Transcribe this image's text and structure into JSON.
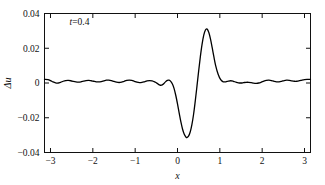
{
  "chart_data": {
    "type": "line",
    "title": "",
    "subtitle": "",
    "xlabel": "x",
    "ylabel": "Δu",
    "xlim": [
      -3.14159,
      3.14159
    ],
    "ylim": [
      -0.04,
      0.04
    ],
    "xticks": [
      -3,
      -2,
      -1,
      0,
      1,
      2,
      3
    ],
    "xticklabels": [
      "−3",
      "−2",
      "−1",
      "0",
      "1",
      "2",
      "3"
    ],
    "yticks": [
      -0.04,
      -0.02,
      0,
      0.02,
      0.04
    ],
    "yticklabels": [
      "−0.04",
      "−0.02",
      "0",
      "0.02",
      "0.04"
    ],
    "grid": false,
    "legend": null,
    "annotations": [
      {
        "text": "t=0.4",
        "italic_prefix": "t",
        "rest": "=0.4",
        "x": -2.55,
        "y": 0.0335
      }
    ],
    "series": [
      {
        "name": "Δu",
        "color": "#000000",
        "linewidth": 1.3,
        "x": [
          -3.1416,
          -3.06,
          -3.0,
          -2.94,
          -2.88,
          -2.82,
          -2.76,
          -2.7,
          -2.64,
          -2.58,
          -2.52,
          -2.46,
          -2.4,
          -2.34,
          -2.28,
          -2.22,
          -2.16,
          -2.1,
          -2.04,
          -1.98,
          -1.92,
          -1.86,
          -1.8,
          -1.74,
          -1.68,
          -1.62,
          -1.56,
          -1.5,
          -1.44,
          -1.38,
          -1.32,
          -1.26,
          -1.2,
          -1.14,
          -1.08,
          -1.02,
          -0.96,
          -0.9,
          -0.84,
          -0.78,
          -0.72,
          -0.66,
          -0.6,
          -0.54,
          -0.48,
          -0.44,
          -0.4,
          -0.36,
          -0.32,
          -0.28,
          -0.24,
          -0.2,
          -0.16,
          -0.12,
          -0.08,
          -0.04,
          0.0,
          0.04,
          0.08,
          0.12,
          0.16,
          0.2,
          0.22,
          0.26,
          0.3,
          0.34,
          0.38,
          0.42,
          0.46,
          0.5,
          0.54,
          0.58,
          0.62,
          0.66,
          0.7,
          0.74,
          0.78,
          0.82,
          0.86,
          0.9,
          0.96,
          1.02,
          1.08,
          1.14,
          1.2,
          1.26,
          1.32,
          1.38,
          1.44,
          1.5,
          1.56,
          1.62,
          1.68,
          1.74,
          1.8,
          1.86,
          1.92,
          1.98,
          2.04,
          2.1,
          2.16,
          2.22,
          2.28,
          2.34,
          2.4,
          2.46,
          2.52,
          2.58,
          2.64,
          2.7,
          2.76,
          2.82,
          2.88,
          2.94,
          3.0,
          3.06,
          3.1416
        ],
        "y": [
          0.0021,
          0.002,
          0.0014,
          0.0006,
          0.0001,
          0.0,
          0.0004,
          0.001,
          0.0014,
          0.0015,
          0.0013,
          0.0009,
          0.0006,
          0.0005,
          0.0007,
          0.0011,
          0.0014,
          0.0015,
          0.0013,
          0.001,
          0.0007,
          0.0006,
          0.0008,
          0.0012,
          0.0016,
          0.0017,
          0.0014,
          0.0009,
          0.0005,
          0.0003,
          0.0005,
          0.001,
          0.0015,
          0.0017,
          0.0015,
          0.001,
          0.0005,
          0.0002,
          0.0003,
          0.0007,
          0.0012,
          0.0014,
          0.0012,
          0.0006,
          -0.0002,
          -0.0009,
          -0.0013,
          -0.0011,
          -0.0003,
          0.0008,
          0.0015,
          0.0016,
          0.0009,
          -0.0006,
          -0.0032,
          -0.0072,
          -0.012,
          -0.0173,
          -0.0224,
          -0.0266,
          -0.0295,
          -0.0311,
          -0.0314,
          -0.0306,
          -0.0282,
          -0.024,
          -0.018,
          -0.0103,
          -0.0018,
          0.007,
          0.0152,
          0.0222,
          0.0275,
          0.0305,
          0.031,
          0.0291,
          0.0253,
          0.0203,
          0.015,
          0.0102,
          0.005,
          0.0019,
          0.0007,
          0.0007,
          0.0011,
          0.0013,
          0.001,
          0.0005,
          0.0001,
          0.0,
          0.0002,
          0.0004,
          0.0004,
          0.0002,
          -0.0001,
          -0.0002,
          0.0,
          0.0005,
          0.0011,
          0.0015,
          0.0016,
          0.0014,
          0.001,
          0.0007,
          0.0007,
          0.001,
          0.0014,
          0.0016,
          0.0015,
          0.0012,
          0.001,
          0.001,
          0.0013,
          0.0017,
          0.002,
          0.0021,
          0.0021
        ]
      }
    ]
  },
  "figure": {
    "background": "#ffffff",
    "axis_color": "#111111",
    "line_color": "#000000"
  }
}
